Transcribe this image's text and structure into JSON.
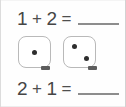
{
  "worksheet": {
    "background_color": "#fefefe",
    "text_color": "#4a4a4a",
    "border_color": "#dcdcdc",
    "pip_color": "#2e2e2e",
    "die_outline_color": "#b9b9b9",
    "blank_line_color": "#8d8d8d"
  },
  "equations": {
    "top": {
      "first_addend": "1",
      "operator": "+",
      "second_addend": "2",
      "equals": "=",
      "answer": ""
    },
    "bottom": {
      "first_addend": "2",
      "operator": "+",
      "second_addend": "1",
      "equals": "=",
      "answer": ""
    }
  },
  "dice": [
    {
      "name": "die-one",
      "pip_count": "1",
      "pips": [
        "center"
      ]
    },
    {
      "name": "die-two",
      "pip_count": "2",
      "pips": [
        "upper-left",
        "lower-right"
      ]
    }
  ]
}
